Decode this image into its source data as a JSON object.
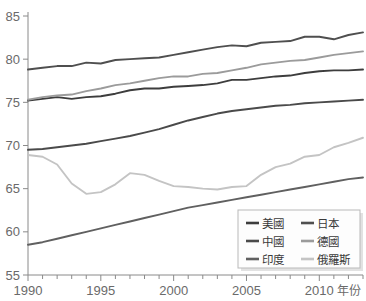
{
  "chart_data": {
    "type": "line",
    "title": "",
    "xlabel": "年份",
    "ylabel": "",
    "xlim": [
      1990,
      2013
    ],
    "ylim": [
      55,
      85
    ],
    "grid": false,
    "legend_position": "bottom-right",
    "x": [
      1990,
      1991,
      1992,
      1993,
      1994,
      1995,
      1996,
      1997,
      1998,
      1999,
      2000,
      2001,
      2002,
      2003,
      2004,
      2005,
      2006,
      2007,
      2008,
      2009,
      2010,
      2011,
      2012,
      2013
    ],
    "xticks": [
      1990,
      1995,
      2000,
      2005,
      2010
    ],
    "xtick_labels": [
      "1990",
      "1995",
      "2000",
      "2005",
      "2010"
    ],
    "yticks": [
      55,
      60,
      65,
      70,
      75,
      80,
      85
    ],
    "ytick_labels": [
      "55",
      "60",
      "65",
      "70",
      "75",
      "80",
      "85"
    ],
    "series": [
      {
        "name": "美國",
        "color": "#3d3d3d",
        "values": [
          75.2,
          75.4,
          75.6,
          75.4,
          75.6,
          75.7,
          76.0,
          76.4,
          76.6,
          76.6,
          76.8,
          76.9,
          77.0,
          77.2,
          77.6,
          77.6,
          77.8,
          78.0,
          78.1,
          78.4,
          78.6,
          78.7,
          78.7,
          78.8
        ]
      },
      {
        "name": "日本",
        "color": "#4f4f4f",
        "values": [
          78.8,
          79.0,
          79.2,
          79.2,
          79.6,
          79.5,
          79.9,
          80.0,
          80.1,
          80.2,
          80.5,
          80.8,
          81.1,
          81.4,
          81.6,
          81.5,
          81.9,
          82.0,
          82.1,
          82.6,
          82.6,
          82.3,
          82.8,
          83.1
        ]
      },
      {
        "name": "中國",
        "color": "#4a4a4a",
        "values": [
          69.5,
          69.6,
          69.8,
          70.0,
          70.2,
          70.5,
          70.8,
          71.1,
          71.5,
          71.9,
          72.4,
          72.9,
          73.3,
          73.7,
          74.0,
          74.2,
          74.4,
          74.6,
          74.7,
          74.9,
          75.0,
          75.1,
          75.2,
          75.3
        ]
      },
      {
        "name": "德國",
        "color": "#9b9b9b",
        "values": [
          75.3,
          75.6,
          75.8,
          75.9,
          76.3,
          76.6,
          77.0,
          77.2,
          77.5,
          77.8,
          78.0,
          78.0,
          78.3,
          78.4,
          78.7,
          79.0,
          79.4,
          79.6,
          79.8,
          79.9,
          80.2,
          80.5,
          80.7,
          80.9
        ]
      },
      {
        "name": "印度",
        "color": "#606060",
        "values": [
          58.5,
          58.8,
          59.2,
          59.6,
          60.0,
          60.4,
          60.8,
          61.2,
          61.6,
          62.0,
          62.4,
          62.8,
          63.1,
          63.4,
          63.7,
          64.0,
          64.3,
          64.6,
          64.9,
          65.2,
          65.5,
          65.8,
          66.1,
          66.3
        ]
      },
      {
        "name": "俄羅斯",
        "color": "#c4c4c4",
        "values": [
          68.9,
          68.7,
          67.8,
          65.6,
          64.4,
          64.6,
          65.5,
          66.8,
          66.6,
          65.9,
          65.3,
          65.2,
          65.0,
          64.9,
          65.2,
          65.3,
          66.6,
          67.5,
          67.9,
          68.7,
          68.9,
          69.8,
          70.3,
          70.9
        ]
      }
    ]
  },
  "legend": {
    "entries": [
      {
        "label": "美國",
        "color": "#3d3d3d"
      },
      {
        "label": "日本",
        "color": "#4f4f4f"
      },
      {
        "label": "中國",
        "color": "#4a4a4a"
      },
      {
        "label": "德國",
        "color": "#9b9b9b"
      },
      {
        "label": "印度",
        "color": "#606060"
      },
      {
        "label": "俄羅斯",
        "color": "#c4c4c4"
      }
    ]
  },
  "axes": {
    "x_axis_title": "年份"
  }
}
